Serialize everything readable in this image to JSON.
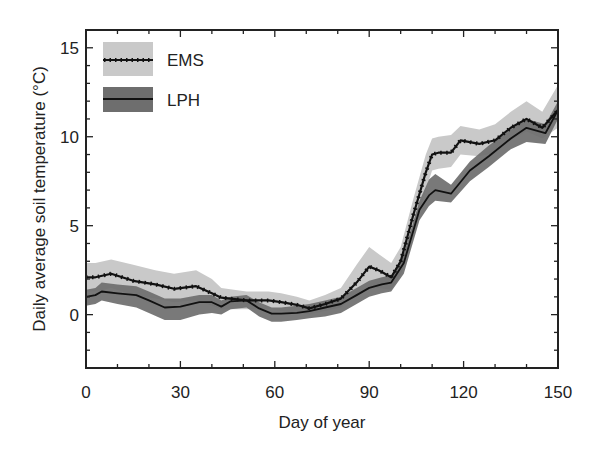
{
  "chart_data": {
    "type": "line",
    "title": "",
    "xlabel": "Day of year",
    "ylabel": "Daily average soil temperature (°C)",
    "xlim": [
      0,
      150
    ],
    "ylim": [
      -3,
      16
    ],
    "xticks": [
      0,
      30,
      60,
      90,
      120,
      150
    ],
    "yticks": [
      0,
      5,
      10,
      15
    ],
    "grid": false,
    "legend_position": "upper left",
    "series": [
      {
        "name": "EMS",
        "band_color": "#c9c9c9",
        "line_style": "dotted-marker",
        "x": [
          0,
          3,
          8,
          15,
          22,
          28,
          35,
          40,
          43,
          51,
          58,
          62,
          67,
          71,
          76,
          81,
          86,
          90,
          93,
          97,
          100,
          104,
          108,
          110,
          112,
          116,
          119,
          125,
          130,
          135,
          140,
          145,
          150
        ],
        "mean": [
          2.1,
          2.1,
          2.3,
          1.9,
          1.7,
          1.45,
          1.6,
          1.2,
          0.95,
          0.8,
          0.8,
          0.7,
          0.55,
          0.35,
          0.6,
          0.9,
          1.8,
          2.7,
          2.5,
          2.1,
          3.0,
          5.6,
          8.0,
          9.0,
          9.1,
          9.1,
          9.8,
          9.6,
          9.8,
          10.5,
          11.0,
          10.5,
          11.5
        ],
        "lower": [
          1.3,
          1.3,
          1.5,
          1.1,
          0.9,
          0.7,
          0.8,
          0.5,
          0.3,
          0.3,
          0.3,
          0.2,
          0.1,
          0.0,
          0.2,
          0.4,
          1.1,
          1.6,
          1.5,
          1.4,
          2.2,
          4.6,
          7.0,
          8.1,
          8.2,
          8.3,
          9.0,
          8.9,
          9.1,
          9.8,
          10.3,
          9.9,
          10.5
        ],
        "upper": [
          2.9,
          2.9,
          3.1,
          2.8,
          2.5,
          2.3,
          2.5,
          2.0,
          1.5,
          1.3,
          1.3,
          1.2,
          1.0,
          0.8,
          1.1,
          1.5,
          2.8,
          3.8,
          3.4,
          2.9,
          3.8,
          6.5,
          9.0,
          9.9,
          10.0,
          10.1,
          10.6,
          10.4,
          10.7,
          11.4,
          12.0,
          11.4,
          12.9
        ]
      },
      {
        "name": "LPH",
        "band_color": "#6e6e6e",
        "line_style": "solid",
        "x": [
          0,
          3,
          5,
          10,
          16,
          20,
          25,
          30,
          36,
          40,
          43,
          46,
          51,
          55,
          59,
          62,
          67,
          71,
          76,
          81,
          86,
          90,
          94,
          97,
          101,
          106,
          109,
          111,
          116,
          122,
          128,
          135,
          140,
          146,
          150
        ],
        "mean": [
          1.0,
          1.1,
          1.3,
          1.2,
          1.1,
          0.8,
          0.4,
          0.45,
          0.7,
          0.7,
          0.45,
          0.75,
          0.8,
          0.35,
          0.05,
          0.05,
          0.1,
          0.2,
          0.4,
          0.6,
          1.1,
          1.5,
          1.7,
          1.8,
          2.9,
          5.9,
          6.7,
          7.0,
          6.8,
          8.1,
          8.9,
          9.9,
          10.5,
          10.2,
          11.5
        ],
        "lower": [
          0.5,
          0.6,
          0.8,
          0.6,
          0.4,
          0.1,
          -0.3,
          -0.3,
          0.0,
          0.1,
          0.0,
          0.3,
          0.4,
          -0.1,
          -0.4,
          -0.4,
          -0.3,
          -0.2,
          -0.1,
          0.1,
          0.6,
          1.0,
          1.2,
          1.3,
          2.3,
          5.3,
          6.1,
          6.4,
          6.3,
          7.5,
          8.3,
          9.3,
          9.7,
          9.6,
          11.0
        ],
        "upper": [
          1.4,
          1.5,
          1.8,
          1.7,
          1.6,
          1.3,
          0.9,
          0.9,
          1.1,
          1.1,
          0.8,
          1.0,
          1.1,
          0.7,
          0.4,
          0.4,
          0.5,
          0.6,
          0.8,
          1.0,
          1.5,
          1.9,
          2.1,
          2.2,
          3.4,
          6.4,
          7.6,
          7.9,
          7.3,
          8.6,
          9.5,
          10.4,
          11.0,
          10.7,
          12.0
        ]
      }
    ]
  }
}
